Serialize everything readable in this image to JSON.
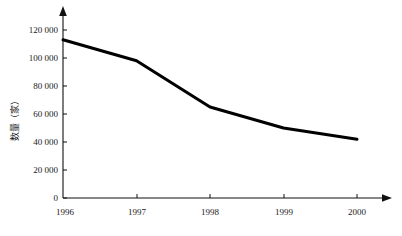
{
  "chart_data": {
    "type": "line",
    "title": "",
    "xlabel": "",
    "ylabel": "数量（家）",
    "categories": [
      "1996",
      "1997",
      "1998",
      "1999",
      "2000"
    ],
    "x": [
      1996,
      1997,
      1998,
      1999,
      2000
    ],
    "values": [
      113000,
      98000,
      65000,
      50000,
      42000
    ],
    "series": [
      {
        "name": "数量（家）",
        "values": [
          113000,
          98000,
          65000,
          50000,
          42000
        ]
      }
    ],
    "ylim": [
      0,
      130000
    ],
    "xlim": [
      1996,
      2000
    ],
    "y_ticks": [
      0,
      20000,
      40000,
      60000,
      80000,
      100000,
      120000
    ],
    "y_tick_labels": [
      "0",
      "20 000",
      "40 000",
      "60 000",
      "80 000",
      "100 000",
      "120 000"
    ],
    "x_ticks": [
      1996,
      1997,
      1998,
      1999,
      2000
    ],
    "x_tick_labels": [
      "1996",
      "1997",
      "1998",
      "1999",
      "2000"
    ],
    "grid": false,
    "legend": false,
    "legend_position": "none",
    "line_color": "#000000",
    "axis_color": "#111111",
    "background_color": "#ffffff",
    "annotations": []
  },
  "axes": {
    "y_axis_title": "数量（家）",
    "y_axis_arrow": "arrow-up-icon",
    "x_axis_arrow": "arrow-right-icon"
  }
}
